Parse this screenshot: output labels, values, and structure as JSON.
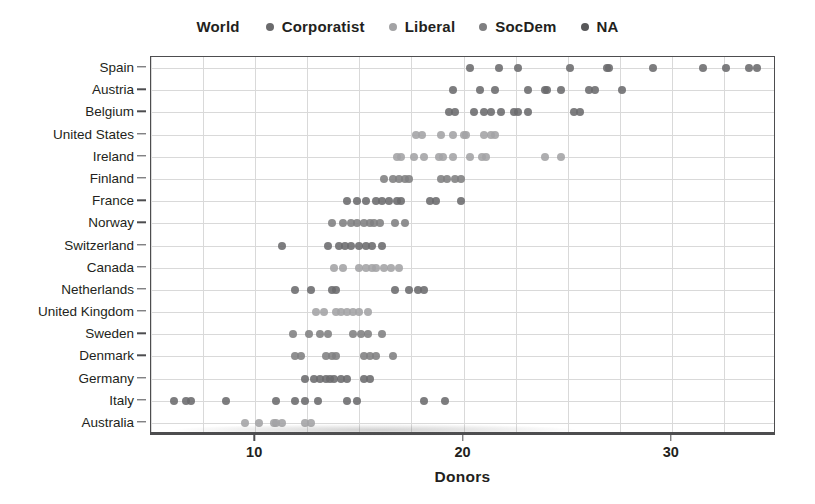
{
  "legend": {
    "title": "World",
    "items": [
      {
        "label": "Corporatist",
        "color": "#6b6b6d"
      },
      {
        "label": "Liberal",
        "color": "#a3a3a5"
      },
      {
        "label": "SocDem",
        "color": "#7f7f81"
      },
      {
        "label": "NA",
        "color": "#58585a"
      }
    ]
  },
  "chart_data": {
    "type": "scatter",
    "title": "",
    "xlabel": "Donors",
    "ylabel": "",
    "xlim": [
      5,
      35
    ],
    "xticks": [
      10,
      20,
      30
    ],
    "xtick_labels": [
      "10",
      "20",
      "30"
    ],
    "grid": true,
    "legend_position": "top-center",
    "categories": [
      "Spain",
      "Austria",
      "Belgium",
      "United States",
      "Ireland",
      "Finland",
      "France",
      "Norway",
      "Switzerland",
      "Canada",
      "Netherlands",
      "United Kingdom",
      "Sweden",
      "Denmark",
      "Germany",
      "Italy",
      "Australia"
    ],
    "series": [
      {
        "name": "Corporatist",
        "color": "#6b6b6d",
        "points": [
          {
            "country": "Spain",
            "values": [
              20.3,
              21.7,
              22.6,
              25.1,
              26.9,
              27.0,
              29.1,
              31.5,
              32.6,
              33.7,
              34.1
            ]
          },
          {
            "country": "Austria",
            "values": [
              19.5,
              20.8,
              21.5,
              23.1,
              23.9,
              24.0,
              24.7,
              26.0,
              26.3,
              27.6
            ]
          },
          {
            "country": "Belgium",
            "values": [
              19.3,
              19.6,
              20.5,
              21.0,
              21.3,
              21.8,
              22.4,
              22.6,
              23.1,
              25.3,
              25.6
            ]
          },
          {
            "country": "France",
            "values": [
              14.4,
              14.9,
              15.3,
              15.8,
              16.1,
              16.4,
              16.8,
              17.0,
              18.4,
              18.7,
              19.9
            ]
          },
          {
            "country": "Switzerland",
            "values": [
              11.3,
              13.5,
              14.0,
              14.3,
              14.6,
              15.0,
              15.3,
              15.6,
              16.1
            ]
          },
          {
            "country": "Netherlands",
            "values": [
              11.9,
              12.7,
              13.7,
              13.9,
              16.7,
              17.4,
              17.8,
              18.1
            ]
          },
          {
            "country": "Germany",
            "values": [
              12.4,
              12.8,
              13.1,
              13.4,
              13.6,
              13.8,
              14.1,
              14.4,
              15.2,
              15.5
            ]
          },
          {
            "country": "Italy",
            "values": [
              6.1,
              6.7,
              6.9,
              8.6,
              11.0,
              11.9,
              12.4,
              13.0,
              14.4,
              14.9,
              18.1,
              19.1
            ]
          }
        ]
      },
      {
        "name": "Liberal",
        "color": "#a3a3a5",
        "points": [
          {
            "country": "United States",
            "values": [
              17.7,
              18.0,
              18.9,
              19.5,
              20.0,
              20.1,
              21.0,
              21.3,
              21.5
            ]
          },
          {
            "country": "Ireland",
            "values": [
              16.8,
              17.0,
              17.6,
              18.1,
              18.8,
              19.0,
              19.5,
              20.3,
              20.9,
              21.1,
              23.9,
              24.7
            ]
          },
          {
            "country": "Canada",
            "values": [
              13.8,
              14.2,
              15.0,
              15.3,
              15.6,
              15.8,
              16.2,
              16.5,
              16.9
            ]
          },
          {
            "country": "United Kingdom",
            "values": [
              12.9,
              13.3,
              13.9,
              14.1,
              14.4,
              14.7,
              15.0,
              15.4
            ]
          },
          {
            "country": "Australia",
            "values": [
              9.5,
              10.2,
              10.9,
              11.0,
              11.3,
              12.4,
              12.7
            ]
          }
        ]
      },
      {
        "name": "SocDem",
        "color": "#7f7f81",
        "points": [
          {
            "country": "Finland",
            "values": [
              16.2,
              16.6,
              16.9,
              17.2,
              17.4,
              18.9,
              19.2,
              19.6,
              19.9
            ]
          },
          {
            "country": "Norway",
            "values": [
              13.7,
              14.2,
              14.6,
              14.9,
              15.2,
              15.5,
              15.7,
              16.0,
              16.7,
              17.2
            ]
          },
          {
            "country": "Sweden",
            "values": [
              11.8,
              12.6,
              13.1,
              13.5,
              14.7,
              15.1,
              15.4,
              16.1
            ]
          },
          {
            "country": "Denmark",
            "values": [
              11.9,
              12.2,
              13.4,
              13.7,
              13.9,
              15.2,
              15.5,
              15.8,
              16.6
            ]
          }
        ]
      },
      {
        "name": "NA",
        "color": "#58585a",
        "points": []
      }
    ]
  },
  "axis": {
    "x_title": "Donors"
  }
}
